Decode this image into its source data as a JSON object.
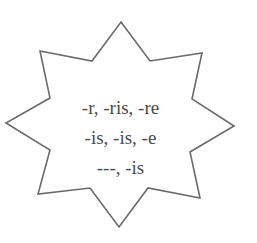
{
  "diagram": {
    "shape": "eight-point-star",
    "colors": {
      "outline": "#6a6a6a",
      "fill": "#ffffff",
      "text": "#4a4a4a"
    },
    "lines": [
      "-r, -ris, -re",
      "-is, -is, -e",
      "---, -is"
    ]
  }
}
